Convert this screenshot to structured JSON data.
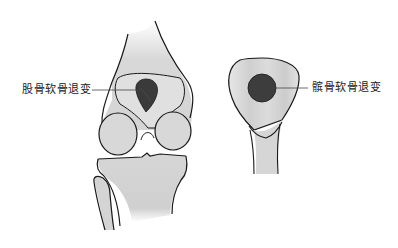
{
  "figure": {
    "left_panel": {
      "subject": "knee-joint-anterior-view",
      "label": "股骨软骨退变"
    },
    "right_panel": {
      "subject": "patella-posterior-view",
      "label": "髌骨软骨退变"
    },
    "colors": {
      "bone_fill": "#d9d9d9",
      "bone_fill_light": "#e8e8e8",
      "outline": "#1a1a1a",
      "lesion": "#3a3a3a",
      "leader_line": "#444444",
      "background": "#ffffff"
    }
  }
}
